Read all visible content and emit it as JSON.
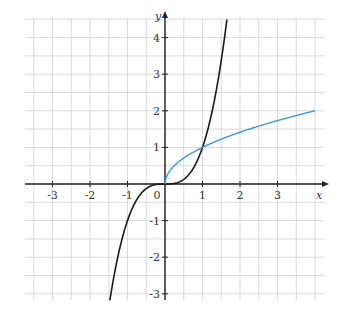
{
  "chart_data": {
    "type": "line",
    "title": "",
    "xlabel": "x",
    "ylabel": "y",
    "xlim": [
      -3.75,
      4.25
    ],
    "ylim": [
      -3.2,
      4.5
    ],
    "grid": true,
    "grid_step": 0.5,
    "x_ticks": [
      -3,
      -2,
      -1,
      0,
      1,
      2,
      3
    ],
    "y_ticks": [
      -3,
      -2,
      -1,
      1,
      2,
      3,
      4
    ],
    "x_tick_labels": [
      "-3",
      "-2",
      "-1",
      "0",
      "1",
      "2",
      "3"
    ],
    "y_tick_labels": [
      "-3",
      "-2",
      "-1",
      "1",
      "2",
      "3",
      "4"
    ],
    "legend": null,
    "series": [
      {
        "name": "y = x^3",
        "color": "#1a1a1a",
        "domain": [
          -1.47,
          1.65
        ],
        "x": [
          -1.47,
          -1.25,
          -1.0,
          -0.75,
          -0.5,
          -0.25,
          0,
          0.25,
          0.5,
          0.75,
          1.0,
          1.25,
          1.5,
          1.65
        ],
        "y": [
          -3.18,
          -1.95,
          -1.0,
          -0.42,
          -0.13,
          -0.02,
          0,
          0.02,
          0.13,
          0.42,
          1.0,
          1.95,
          3.38,
          4.49
        ]
      },
      {
        "name": "y = sqrt(x)",
        "color": "#3a9ad9",
        "domain": [
          0,
          4
        ],
        "x": [
          0,
          0.25,
          0.5,
          1.0,
          1.5,
          2.0,
          2.5,
          3.0,
          3.5,
          4.0
        ],
        "y": [
          0,
          0.5,
          0.71,
          1.0,
          1.22,
          1.41,
          1.58,
          1.73,
          1.87,
          2.0
        ]
      }
    ],
    "annotations": [
      "intersection at (1, 1)",
      "intersection at (0, 0)"
    ]
  },
  "layout": {
    "origin_px": [
      165,
      184
    ],
    "unit_x_px": 37.5,
    "unit_y_px": 36.6,
    "plot_box_px": [
      25,
      18,
      325,
      300
    ]
  },
  "colors": {
    "grid": "#cfcfcf",
    "axis": "#222222",
    "cubic": "#1a1a1a",
    "sqrt": "#3a9ad9"
  }
}
